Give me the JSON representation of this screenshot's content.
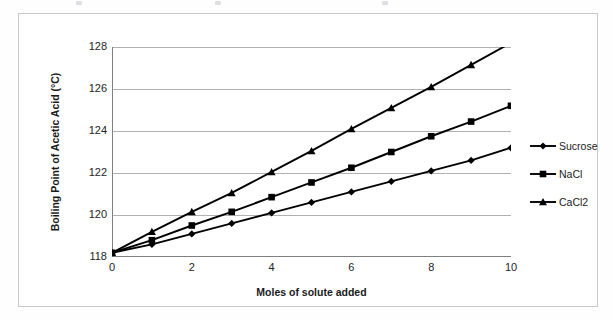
{
  "chart_data": {
    "type": "line",
    "title": "",
    "xlabel": "Moles of solute added",
    "ylabel": "Boiling Point of Acetic Acid (°C)",
    "x": [
      0,
      1,
      2,
      3,
      4,
      5,
      6,
      7,
      8,
      9,
      10
    ],
    "xticks": [
      "0",
      "2",
      "4",
      "6",
      "8",
      "10"
    ],
    "xtick_values": [
      0,
      2,
      4,
      6,
      8,
      10
    ],
    "yticks": [
      "118",
      "120",
      "122",
      "124",
      "126",
      "128"
    ],
    "ytick_values": [
      118,
      120,
      122,
      124,
      126,
      128
    ],
    "xlim": [
      0,
      10
    ],
    "ylim": [
      118,
      128
    ],
    "grid": "horizontal",
    "legend_position": "right",
    "series": [
      {
        "name": "Sucrose",
        "marker": "diamond",
        "color": "#000000",
        "values": [
          118.2,
          118.6,
          119.1,
          119.6,
          120.1,
          120.6,
          121.1,
          121.6,
          122.1,
          122.6,
          123.2
        ]
      },
      {
        "name": "NaCl",
        "marker": "square",
        "color": "#000000",
        "values": [
          118.2,
          118.8,
          119.5,
          120.15,
          120.85,
          121.55,
          122.25,
          123.0,
          123.75,
          124.45,
          125.2
        ]
      },
      {
        "name": "CaCl2",
        "marker": "triangle",
        "color": "#000000",
        "values": [
          118.2,
          119.2,
          120.15,
          121.05,
          122.05,
          123.05,
          124.1,
          125.1,
          126.1,
          127.15,
          128.2
        ]
      }
    ]
  },
  "frame": {
    "border_color": "#c9c9c9",
    "background": "#ffffff",
    "gridline_color": "#b0b0b0",
    "axis_color": "#808080",
    "series_color": "#000000"
  }
}
